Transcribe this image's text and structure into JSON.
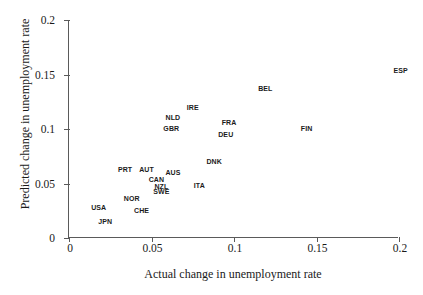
{
  "chart_data": {
    "type": "scatter",
    "title": "",
    "xlabel": "Actual change in unemployment rate",
    "ylabel": "Predicted change in unemployment rate",
    "xlim": [
      0,
      0.2
    ],
    "ylim": [
      0,
      0.2
    ],
    "xticks": [
      "0",
      "0.05",
      "0.1",
      "0.15",
      "0.2"
    ],
    "xtick_values": [
      0,
      0.05,
      0.1,
      0.15,
      0.2
    ],
    "yticks": [
      "0",
      "0.05",
      "0.1",
      "0.15",
      "0.2"
    ],
    "ytick_values": [
      0,
      0.05,
      0.1,
      0.15,
      0.2
    ],
    "grid": false,
    "legend": false,
    "marker_style": "text-label",
    "points": [
      {
        "label": "ESP",
        "x": 0.201,
        "y": 0.154
      },
      {
        "label": "BEL",
        "x": 0.119,
        "y": 0.138
      },
      {
        "label": "IRE",
        "x": 0.075,
        "y": 0.12
      },
      {
        "label": "NLD",
        "x": 0.063,
        "y": 0.111
      },
      {
        "label": "FRA",
        "x": 0.097,
        "y": 0.106
      },
      {
        "label": "FIN",
        "x": 0.144,
        "y": 0.101
      },
      {
        "label": "GBR",
        "x": 0.062,
        "y": 0.101
      },
      {
        "label": "DEU",
        "x": 0.095,
        "y": 0.095
      },
      {
        "label": "DNK",
        "x": 0.088,
        "y": 0.071
      },
      {
        "label": "PRT",
        "x": 0.034,
        "y": 0.063
      },
      {
        "label": "AUT",
        "x": 0.047,
        "y": 0.063
      },
      {
        "label": "AUS",
        "x": 0.063,
        "y": 0.061
      },
      {
        "label": "CAN",
        "x": 0.053,
        "y": 0.054
      },
      {
        "label": "ITA",
        "x": 0.079,
        "y": 0.049
      },
      {
        "label": "NZL",
        "x": 0.056,
        "y": 0.048
      },
      {
        "label": "SWE",
        "x": 0.056,
        "y": 0.043
      },
      {
        "label": "NOR",
        "x": 0.038,
        "y": 0.037
      },
      {
        "label": "USA",
        "x": 0.018,
        "y": 0.028
      },
      {
        "label": "CHE",
        "x": 0.044,
        "y": 0.026
      },
      {
        "label": "JPN",
        "x": 0.022,
        "y": 0.016
      }
    ]
  },
  "colors": {
    "axis": "#5a5a5a",
    "text": "#1a1a1a",
    "point_label": "#1b1b1b",
    "background": "#ffffff"
  }
}
